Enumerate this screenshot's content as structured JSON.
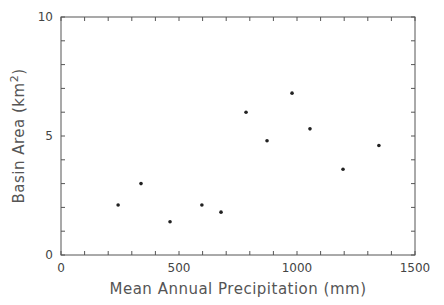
{
  "chart_data": {
    "type": "scatter",
    "title": "",
    "xlabel": "Mean Annual Precipitation (mm)",
    "ylabel": "Basin Area (km²)",
    "ylabel_parts": {
      "main": "Basin Area (km",
      "sup": "2",
      "close": ")"
    },
    "xlim": [
      0,
      1500
    ],
    "ylim": [
      0,
      10
    ],
    "x_ticks": [
      0,
      500,
      1000,
      1500
    ],
    "y_ticks": [
      0,
      5,
      10
    ],
    "x_ticks_labels": [
      "0",
      "500",
      "1000",
      "1500"
    ],
    "y_ticks_labels": [
      "0",
      "5",
      "10"
    ],
    "x_minor_step": 100,
    "y_minor_step": 1,
    "grid": false,
    "legend": null,
    "points": [
      {
        "x": 242,
        "y": 2.1
      },
      {
        "x": 339,
        "y": 3.0
      },
      {
        "x": 462,
        "y": 1.4
      },
      {
        "x": 597,
        "y": 2.1
      },
      {
        "x": 678,
        "y": 1.8
      },
      {
        "x": 784,
        "y": 6.0
      },
      {
        "x": 873,
        "y": 4.8
      },
      {
        "x": 979,
        "y": 6.8
      },
      {
        "x": 1055,
        "y": 5.3
      },
      {
        "x": 1195,
        "y": 3.6
      },
      {
        "x": 1347,
        "y": 4.6
      }
    ],
    "colors": {
      "axis": "#555555",
      "point": "#222222",
      "text": "#555555"
    }
  }
}
